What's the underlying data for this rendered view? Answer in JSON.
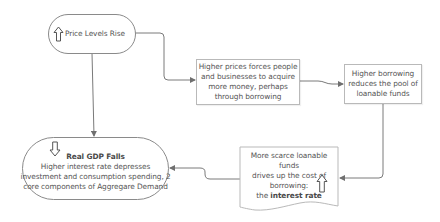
{
  "diagram": {
    "type": "flowchart",
    "nodes": {
      "price_levels": {
        "label": "Price Levels Rise",
        "icon": "hollow-up-arrow-icon"
      },
      "higher_prices": {
        "lines": [
          "Higher prices forces people",
          "and businesses to acquire",
          "more money, perhaps",
          "through borrowing"
        ]
      },
      "higher_borrowing": {
        "lines": [
          "Higher borrowing",
          "reduces the pool of",
          "loanable funds"
        ]
      },
      "scarce_funds": {
        "lines": [
          "More scarce loanable funds",
          "drives up the cost of",
          "borrowing:"
        ],
        "prefix": "the ",
        "emphasis": "interest rate",
        "icon": "hollow-up-arrow-icon"
      },
      "real_gdp": {
        "title": "Real GDP Falls",
        "lines": [
          "Higher interest rate depresses",
          "investment and consumption spending, 2",
          "core components of Aggregare Demand"
        ],
        "icon": "hollow-down-arrow-icon"
      }
    },
    "edges": [
      {
        "from": "price_levels",
        "to": "higher_prices"
      },
      {
        "from": "higher_prices",
        "to": "higher_borrowing"
      },
      {
        "from": "higher_borrowing",
        "to": "scarce_funds"
      },
      {
        "from": "scarce_funds",
        "to": "real_gdp"
      },
      {
        "from": "price_levels",
        "to": "real_gdp"
      }
    ],
    "colors": {
      "stroke": "#7a7a7a",
      "box_border": "#b9b9b9",
      "text": "#555555"
    }
  }
}
